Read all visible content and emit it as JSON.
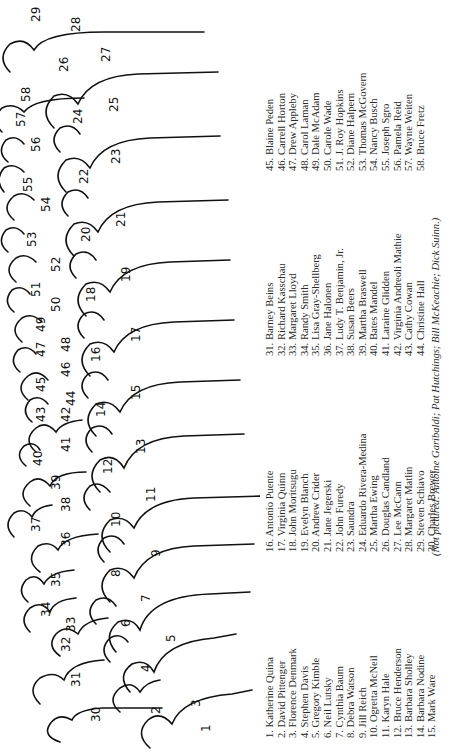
{
  "figure": {
    "labels": [
      "1",
      "2",
      "3",
      "4",
      "5",
      "6",
      "7",
      "8",
      "9",
      "10",
      "11",
      "12",
      "13",
      "14",
      "15",
      "16",
      "17",
      "18",
      "19",
      "20",
      "21",
      "22",
      "23",
      "24",
      "25",
      "26",
      "27",
      "28",
      "29",
      "30",
      "31",
      "32",
      "33",
      "34",
      "35",
      "36",
      "37",
      "38",
      "39",
      "40",
      "41",
      "42",
      "43",
      "44",
      "45",
      "46",
      "47",
      "48",
      "49",
      "50",
      "51",
      "52",
      "53",
      "54",
      "55",
      "56",
      "57",
      "58"
    ]
  },
  "names": {
    "col1": [
      "1. Katherine Quina",
      "2. David Pittenger",
      "3. Florence Denmark",
      "4. Stephen Davis",
      "5. Gregory Kimble",
      "6. Neil Lutsky",
      "7. Cynthia Baum",
      "8. Debra Watson",
      "9. Jill Reich",
      "10. Ogretta McNeil",
      "11. Karyn Hale",
      "12. Bruce Henderson",
      "13. Barbara Sholley",
      "14. Barbara Nodine",
      "15. Mark Ware"
    ],
    "col2": [
      "16. Antonio Puente",
      "17. Virginia Quinn",
      "18. John Moritsugu",
      "19. Evelyn Blanch",
      "20. Andrew Crider",
      "21. Jane Jegerski",
      "22. John Furedy",
      "23. Saundra",
      "24. Eduardo Rivera-Medina",
      "25. Martha Ewing",
      "26. Douglas Candland",
      "27. Lee McCann",
      "28. Margaret Matlin",
      "29. Steven Schiavo",
      "30. Charles Brewer"
    ],
    "col3": [
      "31. Barney Beins",
      "32. Richard Kasschau",
      "33. Margaret Lloyd",
      "34. Randy Smith",
      "35. Lisa Gray-Shellberg",
      "36. Jane Halonen",
      "37. Ludy T. Benjamin, Jr.",
      "38. Susan Beers",
      "39. Martha Braswell",
      "40. Bates Mandel",
      "41. Laraine Glidden",
      "42. Virginia Andreoli Mathie",
      "43. Cathy Cowan",
      "44. Christine Hall"
    ],
    "col4": [
      "45. Blaine Peden",
      "46. Carrell Horton",
      "47. Drew Appleby",
      "48. Carol Laman",
      "49. Dale McAdam",
      "50. Carole Wade",
      "51. J. Roy Hopkins",
      "52. Diane Halpern",
      "53. Thomas McGovern",
      "54. Nancy Busch",
      "55. Joseph Sgro",
      "56. Pamela Reid",
      "57. Wayne Weiten",
      "58. Bruce Fretz"
    ]
  },
  "caption": "(Not pictured: Antoine Garibaldi; Pat Hutchings; Bill McKeachie; Dick Suinn.)"
}
